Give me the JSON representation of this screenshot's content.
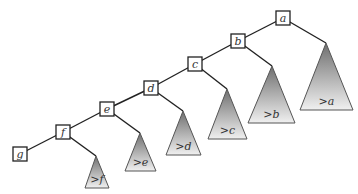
{
  "diagram": {
    "type": "left-skewed binary search tree (spine) with right subtrees",
    "colors": {
      "line": "#222222",
      "triangle_top": "#7a7a7a",
      "triangle_bottom": "#eeeeee",
      "text": "#333333"
    },
    "nodes": [
      {
        "id": "a",
        "label": "a",
        "cx": 283,
        "cy": 18
      },
      {
        "id": "b",
        "label": "b",
        "cx": 238,
        "cy": 41
      },
      {
        "id": "c",
        "label": "c",
        "cx": 195,
        "cy": 64
      },
      {
        "id": "d",
        "label": "d",
        "cx": 151,
        "cy": 88
      },
      {
        "id": "e",
        "label": "e",
        "cx": 107,
        "cy": 109
      },
      {
        "id": "f",
        "label": "f",
        "cx": 63,
        "cy": 132
      },
      {
        "id": "g",
        "label": "g",
        "cx": 20,
        "cy": 154
      }
    ],
    "subtrees": [
      {
        "id": "ta",
        "label": ">a",
        "parent": "a",
        "apex": [
          326,
          43
        ],
        "base_y": 110,
        "left": 300,
        "right": 353
      },
      {
        "id": "tb",
        "label": ">b",
        "parent": "b",
        "apex": [
          272,
          66
        ],
        "base_y": 123,
        "left": 248,
        "right": 295
      },
      {
        "id": "tc",
        "label": ">c",
        "parent": "c",
        "apex": [
          227,
          89
        ],
        "base_y": 139,
        "left": 208,
        "right": 247
      },
      {
        "id": "td",
        "label": ">d",
        "parent": "d",
        "apex": [
          183,
          111
        ],
        "base_y": 155,
        "left": 166,
        "right": 201
      },
      {
        "id": "te",
        "label": ">e",
        "parent": "e",
        "apex": [
          140,
          133
        ],
        "base_y": 171,
        "left": 125,
        "right": 156
      },
      {
        "id": "tf",
        "label": ">f",
        "parent": "f",
        "apex": [
          96,
          156
        ],
        "base_y": 188,
        "left": 85,
        "right": 109
      }
    ],
    "edges": [
      {
        "from": "a",
        "to": "b"
      },
      {
        "from": "b",
        "to": "c"
      },
      {
        "from": "c",
        "to": "d"
      },
      {
        "from": "d",
        "to": "e"
      },
      {
        "from": "e",
        "to": "f"
      },
      {
        "from": "f",
        "to": "g"
      },
      {
        "from": "a",
        "to": "ta"
      },
      {
        "from": "b",
        "to": "tb"
      },
      {
        "from": "c",
        "to": "tc"
      },
      {
        "from": "d",
        "to": "td"
      },
      {
        "from": "e",
        "to": "te"
      },
      {
        "from": "f",
        "to": "tf"
      }
    ]
  }
}
